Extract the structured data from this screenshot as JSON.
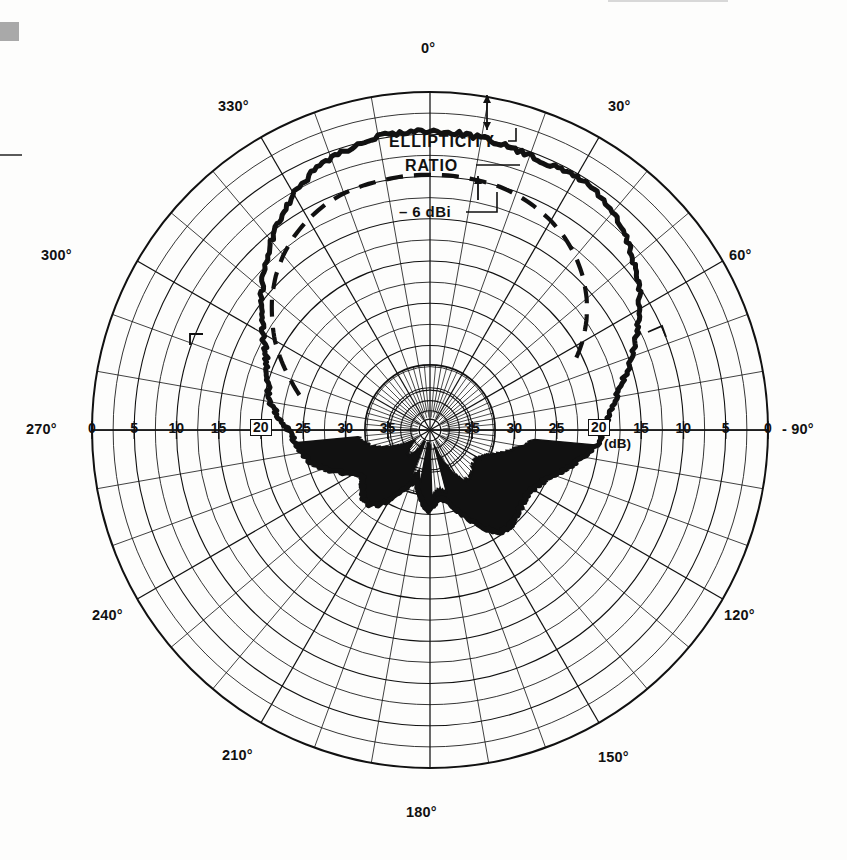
{
  "page": {
    "background_color": "#fdfdfc",
    "ink_color": "#111111"
  },
  "chart_data": {
    "type": "line",
    "projection": "polar",
    "title": "",
    "subtitle": "",
    "xlabel": "",
    "ylabel": "",
    "grid": true,
    "legend_position": "none",
    "angle_unit": "degrees",
    "angle_direction": "clockwise",
    "angle_zero_at": "top",
    "radial_unit": "dB",
    "radial_scale_note": "0 dB at outer circle, increasing attenuation toward center",
    "rlim": [
      0,
      40
    ],
    "angle_ticks": [
      0,
      30,
      60,
      90,
      120,
      150,
      180,
      210,
      240,
      270,
      300,
      330
    ],
    "angle_tick_labels": [
      "0°",
      "30°",
      "60°",
      "90°",
      "120°",
      "150°",
      "180°",
      "210°",
      "240°",
      "270°",
      "300°",
      "330°"
    ],
    "radial_ticks": [
      0,
      5,
      10,
      15,
      20,
      25,
      30,
      35
    ],
    "radial_tick_labels": [
      "0",
      "5",
      "10",
      "15",
      "20",
      "25",
      "30",
      "35"
    ],
    "radial_unit_label": "(dB)",
    "minor_angle_step": 10,
    "series": [
      {
        "name": "Measured pattern",
        "style": "solid-thick-noisy",
        "color": "#111111",
        "points_note": "angle in degrees clockwise from top, value in dB below peak reference",
        "angles": [
          0,
          5,
          10,
          15,
          20,
          25,
          30,
          35,
          40,
          45,
          50,
          55,
          60,
          65,
          70,
          75,
          80,
          85,
          90,
          95,
          100,
          105,
          110,
          115,
          120,
          125,
          130,
          135,
          140,
          145,
          150,
          155,
          160,
          165,
          170,
          175,
          180,
          185,
          190,
          195,
          200,
          205,
          210,
          215,
          220,
          225,
          230,
          235,
          240,
          245,
          250,
          255,
          260,
          265,
          270,
          275,
          280,
          285,
          290,
          295,
          300,
          305,
          310,
          315,
          320,
          325,
          330,
          335,
          340,
          345,
          350,
          355
        ],
        "values": [
          4.6,
          4.7,
          4.9,
          5.2,
          5.5,
          5.6,
          5.3,
          5.6,
          6.4,
          7.4,
          8.6,
          9.9,
          11.4,
          13.0,
          14.6,
          16.2,
          17.6,
          18.6,
          19.4,
          20.2,
          21.6,
          23.0,
          24.4,
          25.4,
          26.0,
          26.2,
          26.0,
          25.6,
          25.2,
          25.4,
          26.4,
          28.0,
          29.6,
          31.0,
          31.8,
          31.4,
          30.4,
          31.2,
          32.6,
          33.6,
          33.4,
          32.0,
          30.4,
          29.2,
          28.6,
          28.8,
          29.6,
          30.2,
          29.6,
          28.2,
          26.6,
          25.4,
          24.6,
          24.0,
          23.2,
          22.0,
          20.8,
          20.2,
          19.6,
          18.6,
          17.2,
          15.6,
          14.0,
          12.4,
          10.8,
          9.2,
          7.8,
          6.6,
          5.8,
          5.2,
          4.8,
          4.6
        ]
      },
      {
        "name": "Ellipticity ratio",
        "style": "dashed",
        "color": "#111111",
        "angles": [
          285,
          290,
          295,
          300,
          305,
          310,
          315,
          320,
          325,
          330,
          335,
          340,
          345,
          350,
          355,
          0,
          5,
          10,
          15,
          20,
          25,
          30,
          35,
          40,
          45,
          50,
          55,
          60,
          65
        ],
        "values": [
          24.0,
          22.4,
          20.6,
          18.8,
          17.2,
          15.6,
          14.2,
          13.0,
          12.0,
          11.2,
          10.6,
          10.2,
          10.0,
          9.9,
          9.8,
          9.8,
          9.8,
          9.9,
          10.0,
          10.3,
          10.8,
          11.4,
          12.2,
          13.2,
          14.4,
          15.8,
          17.4,
          19.2,
          21.2
        ]
      }
    ],
    "annotations": [
      {
        "name": "ellipticity-ratio",
        "text": "ELLIPTICITY",
        "line2": "RATIO"
      },
      {
        "name": "gain-marker",
        "text": "- 6 dBi"
      }
    ]
  },
  "labels": {
    "angles": [
      {
        "id": "a0",
        "text": "0°",
        "x": 421,
        "y": 41
      },
      {
        "id": "a30",
        "text": "30°",
        "x": 608,
        "y": 99
      },
      {
        "id": "a60",
        "text": "60°",
        "x": 729,
        "y": 248
      },
      {
        "id": "a120",
        "text": "120°",
        "x": 724,
        "y": 608
      },
      {
        "id": "a150",
        "text": "150°",
        "x": 598,
        "y": 750
      },
      {
        "id": "a180",
        "text": "180°",
        "x": 406,
        "y": 805
      },
      {
        "id": "a210",
        "text": "210°",
        "x": 222,
        "y": 748
      },
      {
        "id": "a240",
        "text": "240°",
        "x": 92,
        "y": 608
      },
      {
        "id": "a270",
        "text": "270°",
        "x": 26,
        "y": 422
      },
      {
        "id": "a300",
        "text": "300°",
        "x": 41,
        "y": 248
      },
      {
        "id": "a330",
        "text": "330°",
        "x": 218,
        "y": 99
      },
      {
        "id": "a90",
        "text": "- 90°",
        "x": 782,
        "y": 422
      }
    ],
    "radial_left": [
      "0",
      "5",
      "10",
      "15",
      "20",
      "25",
      "30",
      "35"
    ],
    "radial_right": [
      "35",
      "30",
      "25",
      "20",
      "15",
      "10",
      "5",
      "0"
    ],
    "unit": "(dB)",
    "annotation_ellipticity_line1": "ELLIPTICITY",
    "annotation_ellipticity_line2": "RATIO",
    "annotation_dbi": "– 6 dBi"
  },
  "geometry": {
    "center_x": 430,
    "center_y": 430,
    "outer_radius": 338,
    "hub_radius": 42,
    "ring_count": 8
  }
}
